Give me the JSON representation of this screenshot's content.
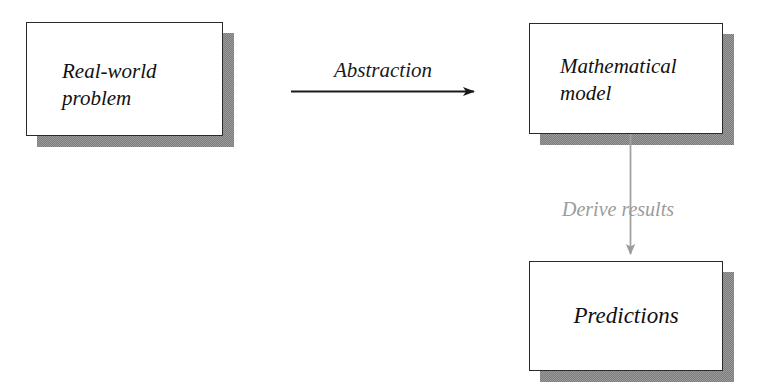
{
  "diagram": {
    "type": "flow-diagram",
    "background_color": "#ffffff",
    "nodes": [
      {
        "id": "real-world",
        "label": "Real-world\nproblem",
        "shape": "rectangle-with-drop-shadow",
        "text_color": "#111111",
        "fill_color": "#ffffff",
        "border_color": "#2b2b2b",
        "shadow_color": "#8a8a8a"
      },
      {
        "id": "math-model",
        "label": "Mathematical\nmodel",
        "shape": "rectangle-with-drop-shadow",
        "text_color": "#111111",
        "fill_color": "#ffffff",
        "border_color": "#2b2b2b",
        "shadow_color": "#8a8a8a"
      },
      {
        "id": "predictions",
        "label": "Predictions",
        "shape": "rectangle-with-drop-shadow",
        "text_color": "#111111",
        "fill_color": "#ffffff",
        "border_color": "#2b2b2b",
        "shadow_color": "#8a8a8a"
      }
    ],
    "edges": [
      {
        "id": "abstraction",
        "label": "Abstraction",
        "from": "real-world",
        "to": "math-model",
        "direction": "right",
        "color": "#1a1a1a"
      },
      {
        "id": "derive-results",
        "label": "Derive  results",
        "from": "math-model",
        "to": "predictions",
        "direction": "down",
        "color": "#9b9b9b"
      }
    ]
  }
}
